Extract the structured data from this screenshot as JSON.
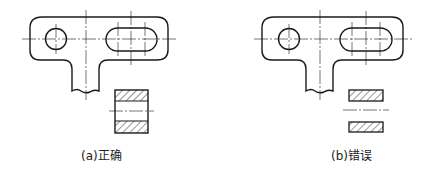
{
  "figures": [
    {
      "id": "a",
      "caption": "(a)正确",
      "verdict": "correct",
      "description": "Bracket plate with round hole and slot; section view shows full rectangle with hatched ends and connecting lines"
    },
    {
      "id": "b",
      "caption": "(b)错误",
      "verdict": "incorrect",
      "description": "Same bracket plate; section view shows only two separate hatched strips without connecting outline"
    }
  ],
  "colors": {
    "line": "#1a1a1a",
    "background": "#ffffff"
  }
}
